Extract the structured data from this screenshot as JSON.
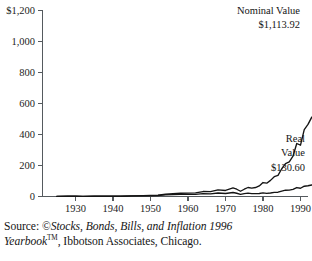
{
  "figure": {
    "name": "nominal-vs-real-value-growth-chart"
  },
  "source_note": {
    "prefix": "Source: ",
    "copyright_symbol": "©",
    "title_italic_line1": "Stocks, Bonds, Bills, and Inflation 1996",
    "title_italic_line2": "Yearbook",
    "trademark": "TM",
    "tail": ", Ibbotson Associates, Chicago."
  },
  "chart_data": {
    "type": "line",
    "title": "",
    "xlabel": "",
    "ylabel": "",
    "xlim": [
      1925,
      1995
    ],
    "ylim": [
      0,
      1200
    ],
    "grid": false,
    "legend_position": "inline-annotations",
    "y_ticks": [
      0,
      200,
      400,
      600,
      800,
      1000,
      1200
    ],
    "y_tick_labels": [
      "0",
      "200",
      "400",
      "600",
      "800",
      "1,000",
      "$1,200"
    ],
    "x_ticks": [
      1930,
      1940,
      1950,
      1960,
      1970,
      1980,
      1990
    ],
    "x_tick_labels": [
      "1930",
      "1940",
      "1950",
      "1960",
      "1970",
      "1980",
      "1990"
    ],
    "annotations": [
      {
        "name": "nominal-value-annotation",
        "lines": [
          "Nominal Value",
          "$1,113.92"
        ],
        "x_px": 300,
        "y_px": 14
      },
      {
        "name": "real-value-annotation",
        "lines": [
          "Real",
          "Value",
          "$130.60"
        ],
        "x_px": 305,
        "y_px": 142
      }
    ],
    "series": [
      {
        "name": "Nominal Value",
        "final_label": "$1,113.92",
        "final_value": 1113.92,
        "x": [
          1925,
          1928,
          1930,
          1932,
          1935,
          1938,
          1940,
          1942,
          1945,
          1948,
          1950,
          1952,
          1954,
          1956,
          1958,
          1960,
          1962,
          1964,
          1966,
          1968,
          1970,
          1972,
          1973,
          1974,
          1975,
          1976,
          1977,
          1978,
          1979,
          1980,
          1981,
          1982,
          1983,
          1984,
          1985,
          1986,
          1987,
          1988,
          1989,
          1990,
          1991,
          1992,
          1993,
          1994,
          1995
        ],
        "values": [
          1,
          2.8,
          1.7,
          0.9,
          1.6,
          1.8,
          1.9,
          1.6,
          4.4,
          5.2,
          6.8,
          9.1,
          14.6,
          17.8,
          21.0,
          22.0,
          23.5,
          32.0,
          31.0,
          43.0,
          39.0,
          55.0,
          47.0,
          34.0,
          47.0,
          58.0,
          54.0,
          58.0,
          68.0,
          90.0,
          86.0,
          104.0,
          128.0,
          136.0,
          179.0,
          212.0,
          223.0,
          260.0,
          342.0,
          331.0,
          432.0,
          465.0,
          512.0,
          519.0,
          713.0
        ]
      },
      {
        "name": "Real Value",
        "final_label": "$130.60",
        "final_value": 130.6,
        "x": [
          1925,
          1928,
          1930,
          1932,
          1935,
          1938,
          1940,
          1942,
          1945,
          1948,
          1950,
          1952,
          1954,
          1956,
          1958,
          1960,
          1962,
          1964,
          1966,
          1968,
          1970,
          1972,
          1973,
          1974,
          1975,
          1976,
          1977,
          1978,
          1979,
          1980,
          1981,
          1982,
          1983,
          1984,
          1985,
          1986,
          1987,
          1988,
          1989,
          1990,
          1991,
          1992,
          1993,
          1994,
          1995
        ],
        "values": [
          1,
          2.9,
          1.9,
          1.2,
          2.1,
          2.4,
          2.5,
          1.8,
          4.2,
          4.2,
          5.0,
          6.4,
          10.2,
          11.8,
          13.3,
          13.6,
          14.2,
          18.8,
          17.4,
          22.6,
          19.3,
          25.8,
          21.0,
          14.0,
          18.4,
          21.7,
          18.7,
          18.5,
          19.6,
          23.0,
          20.0,
          22.8,
          27.1,
          27.6,
          35.0,
          40.6,
          41.2,
          46.0,
          57.8,
          53.0,
          66.4,
          69.3,
          74.0,
          72.6,
          95.0
        ]
      }
    ]
  }
}
